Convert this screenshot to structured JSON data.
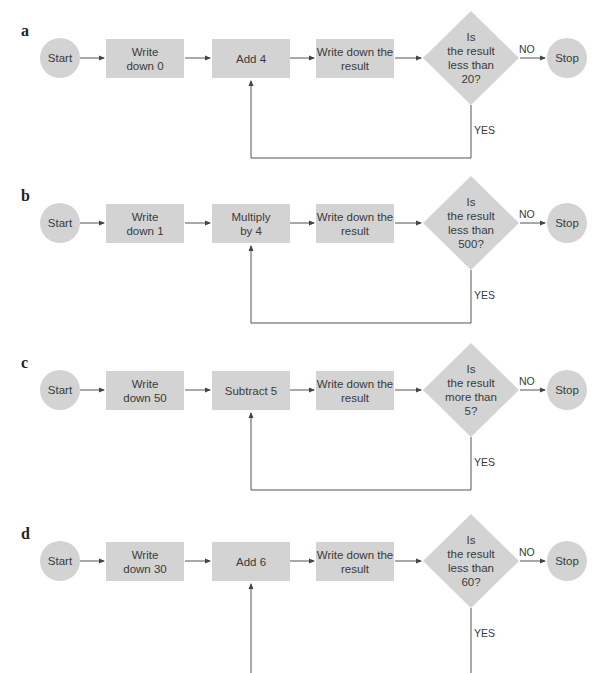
{
  "header": {
    "cropped_text": ""
  },
  "colors": {
    "node_fill": "#d3d3d3",
    "line": "#555555",
    "text": "#3a3a3a"
  },
  "flowcharts": [
    {
      "label": "a",
      "start": "Start",
      "step1": "Write down 0",
      "step2": "Add 4",
      "step3": "Write down the result",
      "decision": [
        "Is",
        "the result",
        "less than",
        "20?"
      ],
      "no": "NO",
      "yes": "YES",
      "stop": "Stop"
    },
    {
      "label": "b",
      "start": "Start",
      "step1": "Write down 1",
      "step2": "Multiply by 4",
      "step3": "Write down the result",
      "decision": [
        "Is",
        "the result",
        "less than",
        "500?"
      ],
      "no": "NO",
      "yes": "YES",
      "stop": "Stop"
    },
    {
      "label": "c",
      "start": "Start",
      "step1": "Write down 50",
      "step2": "Subtract 5",
      "step3": "Write down the result",
      "decision": [
        "Is",
        "the result",
        "more than",
        "5?"
      ],
      "no": "NO",
      "yes": "YES",
      "stop": "Stop"
    },
    {
      "label": "d",
      "start": "Start",
      "step1": "Write down 30",
      "step2": "Add 6",
      "step3": "Write down the result",
      "decision": [
        "Is",
        "the result",
        "less than",
        "60?"
      ],
      "no": "NO",
      "yes": "YES",
      "stop": "Stop"
    }
  ]
}
